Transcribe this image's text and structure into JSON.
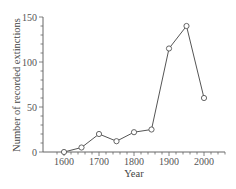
{
  "chart_data": {
    "type": "line",
    "title": "",
    "xlabel": "Year",
    "ylabel": "Number of recorded extinctions",
    "x": [
      1600,
      1650,
      1700,
      1750,
      1800,
      1850,
      1900,
      1950,
      2000
    ],
    "series": [
      {
        "name": "Recorded extinctions",
        "values": [
          0,
          5,
          20,
          12,
          22,
          25,
          115,
          140,
          60
        ]
      }
    ],
    "xlim": [
      1580,
      2060
    ],
    "ylim": [
      0,
      150
    ],
    "x_ticks": [
      1600,
      1700,
      1800,
      1900,
      2000
    ],
    "y_ticks": [
      0,
      50,
      100,
      150
    ],
    "x_minor_step": 20,
    "y_minor_step": 10,
    "grid": false,
    "legend": "none",
    "marker": "open-circle",
    "line_color": "#555555"
  }
}
